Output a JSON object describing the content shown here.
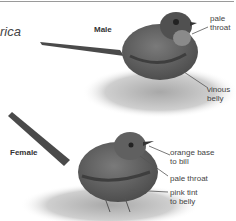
{
  "page": {
    "title_fragment": "rica"
  },
  "male": {
    "label": "Male",
    "annotations": [
      {
        "id": "pale-throat",
        "text_line1": "pale",
        "text_line2": "throat"
      },
      {
        "id": "vinous-belly",
        "text_line1": "vinous",
        "text_line2": "belly"
      }
    ]
  },
  "female": {
    "label": "Female",
    "annotations": [
      {
        "id": "orange-base-to-bill",
        "text_line1": "orange base",
        "text_line2": "to bill"
      },
      {
        "id": "pale-throat",
        "text_line1": "pale throat",
        "text_line2": ""
      },
      {
        "id": "pink-tint-to-belly",
        "text_line1": "pink tint",
        "text_line2": "to belly"
      }
    ]
  },
  "colors": {
    "rule": "#9a9a9a",
    "bird_dark": "#4a4a4a",
    "bird_mid": "#6e6e6e",
    "rock": "#bdbdbd",
    "leader": "#555555"
  }
}
